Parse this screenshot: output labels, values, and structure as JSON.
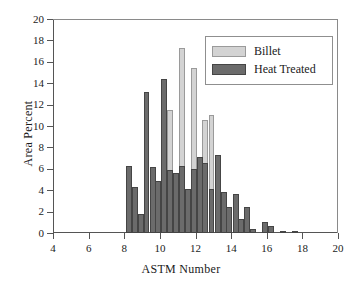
{
  "chart_data": {
    "type": "bar",
    "title": "",
    "xlabel": "ASTM Number",
    "ylabel": "Area Percent",
    "xlim": [
      4,
      20
    ],
    "ylim": [
      0,
      20
    ],
    "xticks": [
      4,
      6,
      8,
      10,
      12,
      14,
      16,
      18,
      20
    ],
    "yticks": [
      0,
      2,
      4,
      6,
      8,
      10,
      12,
      14,
      16,
      18,
      20
    ],
    "grid": false,
    "legend_position": "top-right",
    "bar_width": 0.33,
    "series": [
      {
        "name": "Billet",
        "color": "#d3d3d3",
        "x": [
          10.55,
          11.25,
          11.9,
          12.55,
          12.9
        ],
        "values": [
          11.5,
          17.3,
          15.4,
          10.6,
          11.0
        ]
      },
      {
        "name": "Heat Treated",
        "color": "#6b6b6b",
        "x": [
          8.25,
          8.6,
          8.95,
          9.25,
          9.6,
          9.9,
          10.25,
          10.55,
          10.9,
          11.25,
          11.6,
          11.9,
          12.25,
          12.55,
          12.9,
          13.25,
          13.6,
          13.9,
          14.25,
          14.55,
          14.9,
          15.25,
          15.9,
          16.25,
          16.9,
          17.6
        ],
        "values": [
          6.3,
          4.3,
          1.8,
          13.15,
          6.2,
          4.85,
          14.4,
          5.85,
          5.6,
          6.25,
          4.15,
          6.0,
          7.15,
          6.5,
          4.15,
          7.25,
          3.85,
          2.4,
          3.6,
          1.3,
          2.45,
          0.35,
          1.0,
          0.7,
          0.2,
          0.08
        ]
      }
    ]
  },
  "legend": {
    "items": [
      {
        "label": "Billet",
        "color": "#d3d3d3"
      },
      {
        "label": "Heat Treated",
        "color": "#6b6b6b"
      }
    ]
  }
}
